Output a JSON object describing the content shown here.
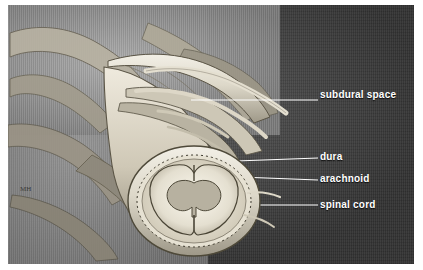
{
  "figure": {
    "background_color": "#4a4a4a",
    "panel_color": "#8d8d8d",
    "label_color": "#ffffff",
    "signature": "MH"
  },
  "labels": [
    {
      "id": "subdural-space",
      "text": "subdural space"
    },
    {
      "id": "dura",
      "text": "dura"
    },
    {
      "id": "arachnoid",
      "text": "arachnoid"
    },
    {
      "id": "spinal-cord",
      "text": "spinal cord"
    }
  ],
  "leader_lines": [
    {
      "id": "leader-subdural",
      "from_label": "subdural space"
    },
    {
      "id": "leader-dura",
      "from_label": "dura"
    },
    {
      "id": "leader-arachnoid",
      "from_label": "arachnoid"
    },
    {
      "id": "leader-spinal-cord",
      "from_label": "spinal cord"
    }
  ]
}
